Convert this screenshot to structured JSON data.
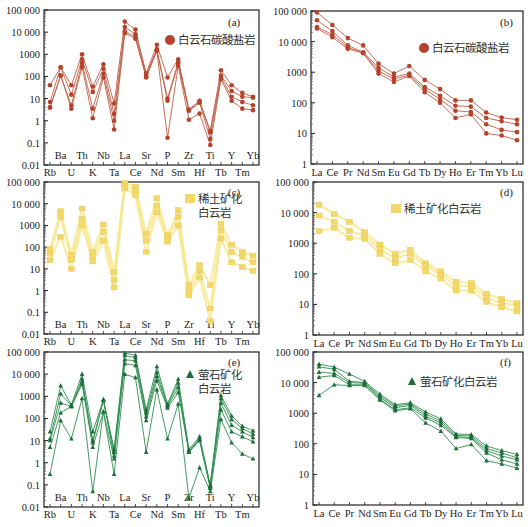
{
  "figure": {
    "yticks": [
      "100 000",
      "10 000",
      "1000",
      "100",
      "10",
      "1",
      "0.1",
      "0.01"
    ],
    "spider_elements_bottom": [
      "Rb",
      "U",
      "K",
      "Ta",
      "Ce",
      "Nd",
      "Sm",
      "Hf",
      "Tb",
      "Tm"
    ],
    "spider_elements_top": [
      "Ba",
      "Th",
      "Nb",
      "La",
      "Sr",
      "P",
      "Zr",
      "Ti",
      "Y",
      "Yb"
    ],
    "ree_elements": [
      "La",
      "Ce",
      "Pr",
      "Nd",
      "Sm",
      "Eu",
      "Gd",
      "Tb",
      "Dy",
      "Ho",
      "Er",
      "Tm",
      "Yb",
      "Lu"
    ]
  },
  "chart_data": [
    {
      "id": "a",
      "panel_label": "(a)",
      "type": "line",
      "scale": "log",
      "legend": "白云石碳酸盐岩",
      "marker": "circle",
      "color": "#b5432b",
      "line_color": "#c0604a",
      "x": [
        "Rb",
        "Ba",
        "U",
        "Th",
        "K",
        "Nb",
        "Ta",
        "La",
        "Ce",
        "Sr",
        "Nd",
        "P",
        "Sm",
        "Zr",
        "Hf",
        "Ti",
        "Tb",
        "Y",
        "Tm",
        "Yb"
      ],
      "ylim": [
        0.01,
        100000
      ],
      "series": [
        {
          "name": "s1",
          "values": [
            40,
            260,
            40,
            1000,
            35,
            350,
            6,
            30000,
            13000,
            140,
            2700,
            90,
            600,
            3.2,
            8,
            0.35,
            190,
            40,
            18,
            12
          ]
        },
        {
          "name": "s2",
          "values": [
            7,
            260,
            15,
            600,
            20,
            220,
            2,
            17000,
            8000,
            120,
            1700,
            10,
            450,
            3,
            7,
            0.3,
            110,
            22,
            12,
            11
          ]
        },
        {
          "name": "s3",
          "values": [
            4,
            110,
            5,
            400,
            3.5,
            130,
            1,
            11000,
            6000,
            100,
            1500,
            8,
            380,
            2.8,
            6.5,
            0.15,
            90,
            12,
            7,
            5
          ]
        },
        {
          "name": "s4",
          "values": [
            4,
            110,
            3.5,
            270,
            1.3,
            90,
            0.4,
            9000,
            5000,
            90,
            1400,
            0.17,
            300,
            1.1,
            2.1,
            0.08,
            75,
            8,
            3.5,
            3
          ]
        }
      ]
    },
    {
      "id": "b",
      "panel_label": "(b)",
      "type": "line",
      "scale": "log",
      "legend": "白云石碳酸盐岩",
      "marker": "circle",
      "color": "#b5432b",
      "line_color": "#c0604a",
      "x": [
        "La",
        "Ce",
        "Pr",
        "Nd",
        "Sm",
        "Eu",
        "Gd",
        "Tb",
        "Dy",
        "Ho",
        "Er",
        "Tm",
        "Yb",
        "Lu"
      ],
      "ylim": [
        1,
        100000
      ],
      "series": [
        {
          "name": "s1",
          "values": [
            90000,
            35000,
            13000,
            7500,
            1900,
            900,
            1600,
            560,
            280,
            120,
            120,
            48,
            33,
            28
          ]
        },
        {
          "name": "s2",
          "values": [
            50000,
            22000,
            7500,
            4500,
            1400,
            700,
            900,
            330,
            170,
            80,
            75,
            32,
            25,
            20
          ]
        },
        {
          "name": "s3",
          "values": [
            30000,
            17000,
            6500,
            4300,
            1100,
            600,
            800,
            280,
            130,
            55,
            50,
            20,
            13,
            11
          ]
        },
        {
          "name": "s4",
          "values": [
            27000,
            14000,
            5800,
            4200,
            900,
            480,
            750,
            220,
            100,
            32,
            42,
            10,
            8.5,
            6
          ]
        }
      ]
    },
    {
      "id": "c",
      "panel_label": "(c)",
      "type": "line",
      "scale": "log",
      "legend": "稀土矿化\n白云岩",
      "legend_lines": [
        "稀土矿化",
        "白云岩"
      ],
      "marker": "square",
      "color": "#f2d86a",
      "line_color": "#f5e58a",
      "x": [
        "Rb",
        "Ba",
        "U",
        "Th",
        "K",
        "Nb",
        "Ta",
        "La",
        "Ce",
        "Sr",
        "Nd",
        "P",
        "Sm",
        "Zr",
        "Hf",
        "Ti",
        "Tb",
        "Y",
        "Tm",
        "Yb"
      ],
      "ylim": [
        0.01,
        100000
      ],
      "series": [
        {
          "name": "s1",
          "values": [
            80,
            4500,
            45,
            6000,
            60,
            1100,
            7,
            90000,
            60000,
            400,
            18000,
            350,
            5000,
            1.8,
            15,
            1.8,
            1200,
            130,
            60,
            40
          ]
        },
        {
          "name": "s2",
          "values": [
            50,
            2500,
            25,
            2000,
            35,
            500,
            3,
            70000,
            40000,
            200,
            8000,
            250,
            2500,
            1,
            8,
            0.15,
            600,
            60,
            35,
            20
          ]
        },
        {
          "name": "s3",
          "values": [
            25,
            300,
            10,
            1000,
            22,
            200,
            1.4,
            50000,
            25000,
            60,
            4000,
            180,
            1000,
            0.6,
            4,
            0.04,
            250,
            20,
            12,
            8
          ]
        }
      ]
    },
    {
      "id": "d",
      "panel_label": "(d)",
      "type": "line",
      "scale": "log",
      "legend": "稀土矿化白云岩",
      "marker": "square",
      "color": "#f2d86a",
      "line_color": "#f5e58a",
      "x": [
        "La",
        "Ce",
        "Pr",
        "Nd",
        "Sm",
        "Eu",
        "Gd",
        "Tb",
        "Dy",
        "Ho",
        "Er",
        "Tm",
        "Yb",
        "Lu"
      ],
      "ylim": [
        1,
        100000
      ],
      "series": [
        {
          "name": "s1",
          "values": [
            18000,
            9000,
            5000,
            2300,
            900,
            450,
            600,
            220,
            120,
            55,
            50,
            22,
            15,
            11
          ]
        },
        {
          "name": "s2",
          "values": [
            8000,
            5000,
            2500,
            1800,
            650,
            320,
            450,
            180,
            95,
            40,
            40,
            16,
            11,
            9
          ]
        },
        {
          "name": "s3",
          "values": [
            2500,
            3200,
            1500,
            1400,
            450,
            220,
            280,
            120,
            70,
            28,
            28,
            12,
            8,
            6
          ]
        }
      ]
    },
    {
      "id": "e",
      "panel_label": "(e)",
      "type": "line",
      "scale": "log",
      "legend": "萤石矿化\n白云岩",
      "legend_lines": [
        "萤石矿化",
        "白云岩"
      ],
      "marker": "triangle",
      "color": "#1f6b3a",
      "line_color": "#2f8f50",
      "x": [
        "Rb",
        "Ba",
        "U",
        "Th",
        "K",
        "Nb",
        "Ta",
        "La",
        "Ce",
        "Sr",
        "Nd",
        "P",
        "Sm",
        "Zr",
        "Hf",
        "Ti",
        "Tb",
        "Y",
        "Tm",
        "Yb"
      ],
      "ylim": [
        0.01,
        100000
      ],
      "series": [
        {
          "name": "s1",
          "values": [
            25,
            3000,
            400,
            10000,
            25,
            700,
            4,
            90000,
            70000,
            250,
            22000,
            450,
            6000,
            4,
            15,
            0.1,
            1100,
            130,
            45,
            28
          ]
        },
        {
          "name": "s2",
          "values": [
            12,
            1300,
            380,
            6000,
            10,
            700,
            3,
            70000,
            55000,
            180,
            12000,
            400,
            4000,
            3.5,
            12,
            0.09,
            800,
            90,
            35,
            20
          ]
        },
        {
          "name": "s3",
          "values": [
            10,
            500,
            350,
            4500,
            8,
            650,
            2,
            45000,
            40000,
            120,
            8000,
            350,
            2500,
            3,
            11,
            0.08,
            500,
            50,
            25,
            14
          ]
        },
        {
          "name": "s4",
          "values": [
            5,
            180,
            350,
            3500,
            5,
            200,
            1.5,
            30000,
            25000,
            80,
            5000,
            300,
            1500,
            3,
            10,
            0.07,
            250,
            25,
            15,
            9
          ]
        },
        {
          "name": "s5",
          "values": [
            0.3,
            80,
            12,
            800,
            0.05,
            200,
            0.3,
            10000,
            7000,
            3,
            2000,
            12,
            450,
            0.025,
            0.6,
            0.05,
            90,
            8,
            2.5,
            1.5
          ]
        }
      ]
    },
    {
      "id": "f",
      "panel_label": "(f)",
      "type": "line",
      "scale": "log",
      "legend": "萤石矿化白云岩",
      "marker": "triangle",
      "color": "#1f6b3a",
      "line_color": "#2f8f50",
      "x": [
        "La",
        "Ce",
        "Pr",
        "Nd",
        "Sm",
        "Eu",
        "Gd",
        "Tb",
        "Dy",
        "Ho",
        "Er",
        "Tm",
        "Yb",
        "Lu"
      ],
      "ylim": [
        1,
        100000
      ],
      "series": [
        {
          "name": "s1",
          "values": [
            40000,
            32000,
            19000,
            11000,
            4200,
            1900,
            2200,
            1100,
            650,
            210,
            200,
            85,
            60,
            45
          ]
        },
        {
          "name": "s2",
          "values": [
            33000,
            27000,
            11000,
            10000,
            3700,
            1700,
            2000,
            950,
            550,
            190,
            180,
            70,
            50,
            35
          ]
        },
        {
          "name": "s3",
          "values": [
            22000,
            20000,
            10000,
            9500,
            3300,
            1500,
            1800,
            800,
            480,
            170,
            160,
            60,
            40,
            30
          ]
        },
        {
          "name": "s4",
          "values": [
            15000,
            17000,
            8500,
            8500,
            2900,
            1300,
            1500,
            700,
            400,
            160,
            150,
            50,
            30,
            22
          ]
        },
        {
          "name": "s5",
          "values": [
            3800,
            8500,
            8000,
            8000,
            2700,
            1200,
            1400,
            480,
            260,
            70,
            95,
            28,
            22,
            16
          ]
        }
      ]
    }
  ]
}
